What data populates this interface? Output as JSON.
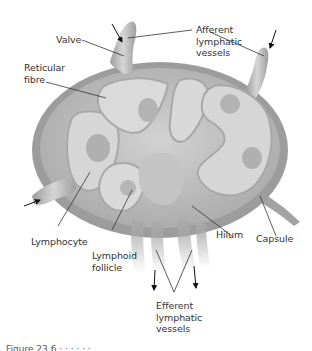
{
  "diagram": {
    "labels": {
      "valve": "Valve",
      "afferent": [
        "Afferent",
        "lymphatic",
        "vessels"
      ],
      "reticular": [
        "Reticular",
        "fibre"
      ],
      "lymphocyte": "Lymphocyte",
      "follicle": [
        "Lymphoid",
        "follicle"
      ],
      "hilum": "Hilum",
      "capsule": "Capsule",
      "efferent": [
        "Efferent",
        "lymphatic",
        "vessels"
      ]
    },
    "caption_partial": "Figure 23.6  ·  ·  ·  ·  ·  ·",
    "colors": {
      "capsule": "#9a9a9a",
      "cortex": "#c9c9c9",
      "medulla": "#b3b3b3",
      "follicle_center": "#a8a8a8",
      "vessel": "#b8b8b8",
      "line": "#333333"
    }
  }
}
